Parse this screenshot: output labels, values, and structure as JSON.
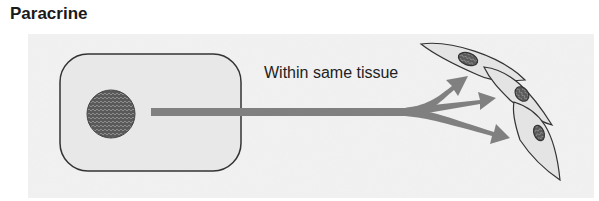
{
  "title": "Paracrine",
  "label": "Within same tissue",
  "colors": {
    "background_stipple": "#ececec",
    "cell_fill": "#e6e6e6",
    "cell_outline": "#333333",
    "nucleus": "#6a6a6a",
    "arrow": "#808080"
  },
  "elements": {
    "signaling_cell": "rectangular-cell-with-nucleus",
    "target_cells": [
      "spindle-cell-1",
      "spindle-cell-2",
      "spindle-cell-3"
    ],
    "arrows": 3
  }
}
